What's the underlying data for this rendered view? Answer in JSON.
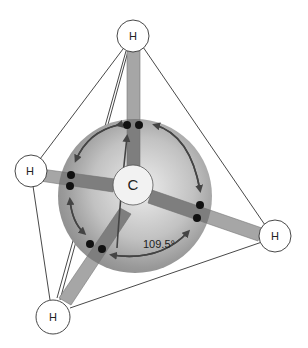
{
  "diagram": {
    "central_atom": {
      "label": "C",
      "x": 133,
      "y": 185,
      "r": 20
    },
    "hydrogens": [
      {
        "id": "top",
        "label": "H",
        "x": 133,
        "y": 36,
        "r": 16
      },
      {
        "id": "left",
        "label": "H",
        "x": 31,
        "y": 171,
        "r": 16
      },
      {
        "id": "right",
        "label": "H",
        "x": 275,
        "y": 236,
        "r": 16
      },
      {
        "id": "bottom",
        "label": "H",
        "x": 53,
        "y": 317,
        "r": 17
      }
    ],
    "bond_angle_label": "109.5°",
    "colors": {
      "sphere_light": "#e6e6e6",
      "sphere_dark": "#8a8a8a",
      "bond_fill": "#9e9e9e",
      "bond_inside": "#6f6f6f",
      "electron": "#111111",
      "line": "#333333",
      "atom_fill": "#ffffff"
    }
  }
}
